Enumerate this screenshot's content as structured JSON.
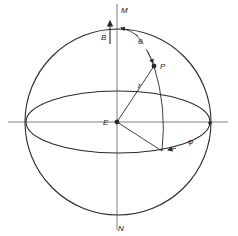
{
  "diagram": {
    "title": "",
    "labels": {
      "M": "M",
      "N": "N",
      "B": "B",
      "E": "E",
      "P": "P",
      "r": "r",
      "theta": "θ",
      "phi": "φ"
    },
    "colors": {
      "stroke": "#2a2a2a",
      "background": "#ffffff"
    }
  }
}
